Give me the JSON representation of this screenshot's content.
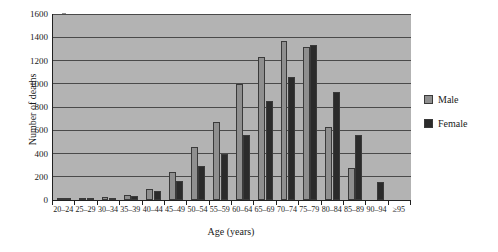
{
  "chart_data": {
    "type": "bar",
    "title": "",
    "xlabel": "Age (years)",
    "ylabel": "Number of deaths",
    "categories": [
      "20–24",
      "25–29",
      "30–34",
      "35–39",
      "40–44",
      "45–49",
      "50–54",
      "55–59",
      "60–64",
      "65–69",
      "70–74",
      "75–79",
      "80–84",
      "85–89",
      "90–94",
      "≥95"
    ],
    "series": [
      {
        "name": "Male",
        "color": "#8f8f8f",
        "values": [
          5,
          10,
          22,
          45,
          95,
          245,
          460,
          675,
          1000,
          1230,
          1370,
          1320,
          630,
          275,
          0,
          0
        ]
      },
      {
        "name": "Female",
        "color": "#2b2b2b",
        "values": [
          3,
          8,
          18,
          38,
          75,
          160,
          290,
          395,
          560,
          855,
          1060,
          1330,
          930,
          555,
          155,
          0
        ]
      }
    ],
    "ylim": [
      0,
      1600
    ],
    "yticks": [
      0,
      200,
      400,
      600,
      800,
      1000,
      1200,
      1400,
      1600
    ],
    "ytick_labels": [
      "0",
      "200",
      "400",
      "600",
      "800",
      "1000",
      "1200",
      "1400",
      "1600"
    ],
    "grid": true,
    "legend_position": "right",
    "plot_background": "#b3b3b3"
  }
}
